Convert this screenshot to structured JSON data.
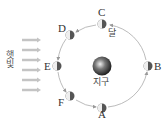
{
  "diagram": {
    "sunlight_label": "햇빛",
    "earth_label": "지구",
    "moon_label": "달",
    "positions": [
      {
        "id": "A",
        "label": "A"
      },
      {
        "id": "B",
        "label": "B"
      },
      {
        "id": "C",
        "label": "C"
      },
      {
        "id": "D",
        "label": "D"
      },
      {
        "id": "E",
        "label": "E"
      },
      {
        "id": "F",
        "label": "F"
      }
    ],
    "orbit_direction": "counterclockwise",
    "sunlight_arrow_count": 6,
    "colors": {
      "orbit": "#aaaaaa",
      "arrow": "#bbbbbb",
      "moon_lit": "#eeeeee",
      "moon_dark": "#555555",
      "earth": "#444444"
    }
  }
}
